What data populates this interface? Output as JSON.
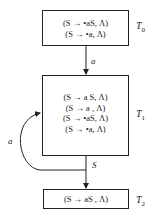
{
  "diagram": {
    "states": [
      {
        "id": "T0",
        "label": "T",
        "subscript": "0",
        "items": [
          "(S → •aS, Λ)",
          "(S → •a, Λ)"
        ]
      },
      {
        "id": "T1",
        "label": "T",
        "subscript": "1",
        "items": [
          "(S → a S, Λ)",
          "(S → a , Λ)",
          "(S → •aS, Λ)",
          "(S → •a, Λ)"
        ]
      },
      {
        "id": "T2",
        "label": "T",
        "subscript": "2",
        "items": [
          "(S → aS , Λ)"
        ]
      }
    ],
    "edges": [
      {
        "from": "T0",
        "to": "T1",
        "label": "a"
      },
      {
        "from": "T1",
        "to": "T1",
        "label": "a"
      },
      {
        "from": "T1",
        "to": "T2",
        "label": "S"
      }
    ]
  }
}
